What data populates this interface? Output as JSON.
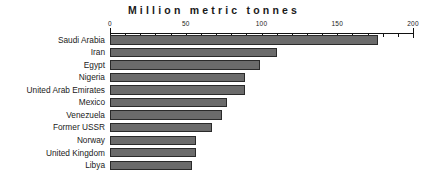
{
  "chart_data": {
    "type": "bar",
    "orientation": "horizontal",
    "title": "Million metric tonnes",
    "xlabel": "",
    "ylabel": "",
    "xlim": [
      0,
      200
    ],
    "grid": false,
    "legend": null,
    "x_major_ticks": [
      0,
      50,
      100,
      150,
      200
    ],
    "x_tick_labels": [
      "0",
      "50",
      "100",
      "150",
      "200"
    ],
    "x_minor_tick_step": 10,
    "categories": [
      "Saudi Arabia",
      "Iran",
      "Egypt",
      "Nigeria",
      "United Arab Emirates",
      "Mexico",
      "Venezuela",
      "Former USSR",
      "Norway",
      "United Kingdom",
      "Libya"
    ],
    "values": [
      177,
      110,
      99,
      89,
      89,
      77,
      74,
      67,
      57,
      57,
      54
    ],
    "bar_color": "#6b6b6b",
    "bar_border_color": "#2a2a2a",
    "axis_color": "#111111",
    "background": "#ffffff"
  }
}
